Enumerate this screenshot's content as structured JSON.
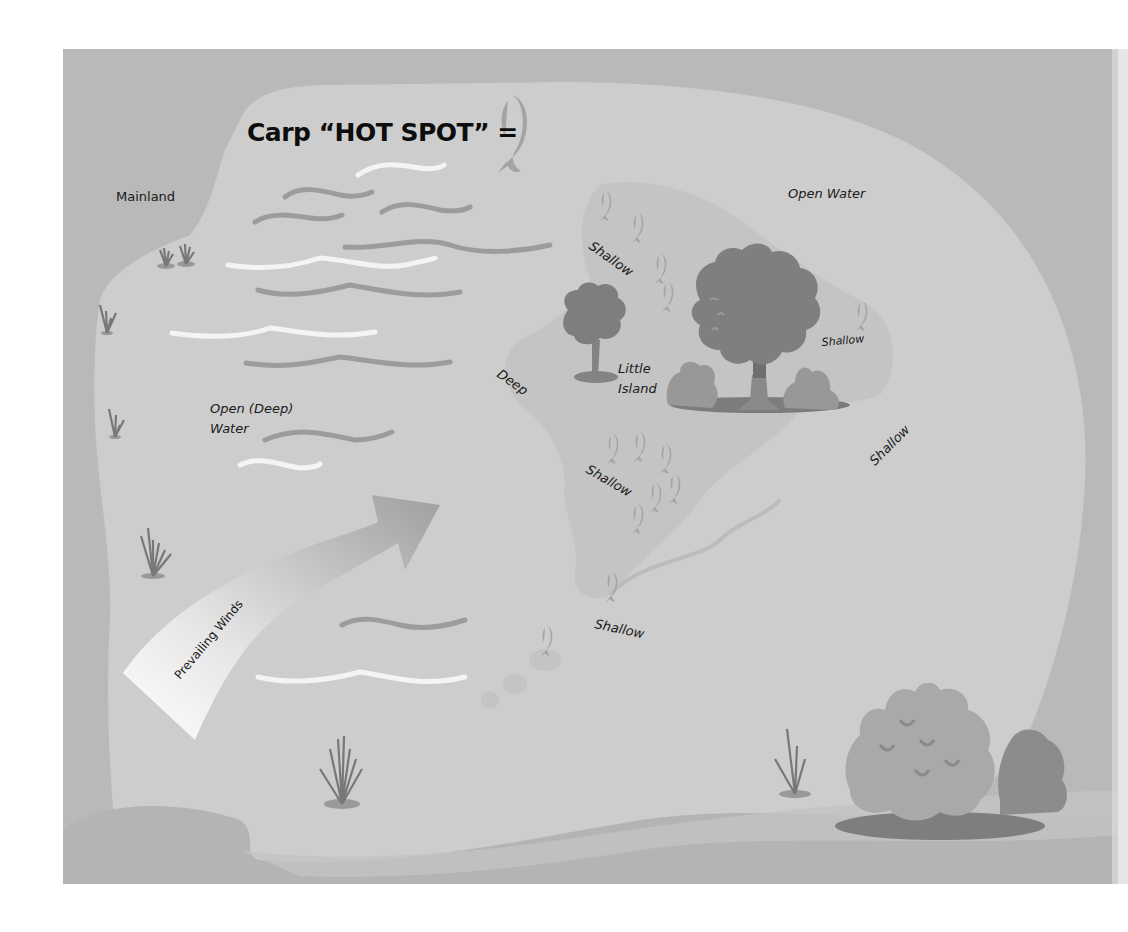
{
  "title": "Carp “HOT SPOT” =",
  "legend": {
    "icon": "carp-fish-icon",
    "meaning": "Carp hot spot"
  },
  "labels": {
    "mainland": "Mainland",
    "open_water": "Open Water",
    "open_deep_water_line1": "Open (Deep)",
    "open_deep_water_line2": "Water",
    "deep": "Deep",
    "little_island_line1": "Little",
    "little_island_line2": "Island",
    "shallow_north": "Shallow",
    "shallow_east_inner": "Shallow",
    "shallow_east_outer": "Shallow",
    "shallow_south": "Shallow",
    "shallow_southwest": "Shallow",
    "prevailing_winds": "Prevailing Winds"
  },
  "colors": {
    "mainland": "#b9b9b9",
    "water": "#cdcdcd",
    "shallow": "#c3c3c3",
    "island_shallow": "#c6c6c6",
    "tree_dark": "#7d7d7d",
    "tree_mid": "#8f8f8f",
    "bush": "#9a9a9a",
    "fish": "#a5a5a5",
    "grass": "#777777",
    "text": "#1a1a1a"
  },
  "hotspots": {
    "north_shallow_fish_count": 5,
    "east_shallow_fish_count": 1,
    "south_shallow_fish_count": 7,
    "southwest_shallow_fish_count": 2
  }
}
